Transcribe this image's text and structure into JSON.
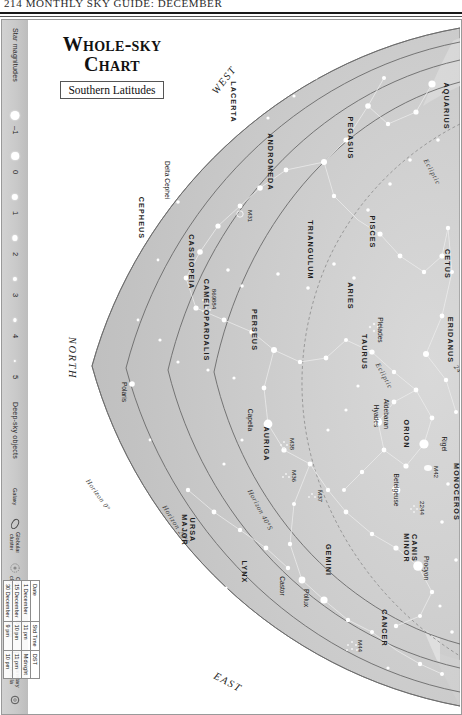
{
  "running_head": "214   MONTHLY SKY GUIDE: DECEMBER",
  "title": {
    "line1": "Whole-sky",
    "line2": "Chart",
    "subtitle": "Southern Latitudes"
  },
  "legend": {
    "magnitudes": {
      "heading": "Star magnitudes",
      "items": [
        {
          "label": "–1",
          "size": 9
        },
        {
          "label": "0",
          "size": 7.6
        },
        {
          "label": "1",
          "size": 6.4
        },
        {
          "label": "2",
          "size": 5.2
        },
        {
          "label": "3",
          "size": 4.2
        },
        {
          "label": "4",
          "size": 3.2
        },
        {
          "label": "5",
          "size": 2.4
        }
      ]
    },
    "deep_sky": {
      "heading": "Deep-sky objects",
      "items": [
        {
          "label": "Galaxy",
          "icon": "ellipse-outline-icon"
        },
        {
          "label": "Globular\ncluster",
          "icon": "globular-cluster-icon"
        },
        {
          "label": "Open\ncluster",
          "icon": "open-cluster-icon"
        },
        {
          "label": "Diffuse\nnebula",
          "icon": "square-outline-icon"
        },
        {
          "label": "Planetary\nnebula",
          "icon": "circle-outline-icon"
        }
      ]
    }
  },
  "date_table": {
    "headers": [
      "Date",
      "Std Time",
      "DST"
    ],
    "rows": [
      [
        "1 December",
        "11 pm",
        "Midnight"
      ],
      [
        "15 December",
        "10 pm",
        "11 pm"
      ],
      [
        "30 December",
        "9 pm",
        "10 pm"
      ]
    ]
  },
  "directions": [
    {
      "label": "WEST",
      "x": 196,
      "y": 60,
      "rot": -52
    },
    {
      "label": "NORTH",
      "x": 44,
      "y": 338,
      "rot": 90
    },
    {
      "label": "EAST",
      "x": 200,
      "y": 662,
      "rot": 28
    }
  ],
  "horizon_labels": [
    {
      "label": "Horizon 0°",
      "x": 70,
      "y": 475,
      "rot": 55
    },
    {
      "label": "Horizon 20°S",
      "x": 148,
      "y": 505,
      "rot": 58
    },
    {
      "label": "Horizon 40°S",
      "x": 232,
      "y": 490,
      "rot": 62
    },
    {
      "label": "24°S",
      "x": 432,
      "y": 352,
      "rot": 52
    }
  ],
  "ecliptic_labels": [
    {
      "label": "Ecliptic",
      "x": 404,
      "y": 152,
      "rot": 62
    },
    {
      "label": "Ecliptic",
      "x": 356,
      "y": 356,
      "rot": 62
    }
  ],
  "constellations": [
    {
      "name": "AQUARIUS",
      "x": 418,
      "y": 86,
      "rot": 90
    },
    {
      "name": "PEGASUS",
      "x": 322,
      "y": 118,
      "rot": 90
    },
    {
      "name": "LACERTA",
      "x": 205,
      "y": 82,
      "rot": 90
    },
    {
      "name": "ANDROMEDA",
      "x": 242,
      "y": 142,
      "rot": 90
    },
    {
      "name": "PISCES",
      "x": 344,
      "y": 212,
      "rot": 90
    },
    {
      "name": "CETUS",
      "x": 419,
      "y": 244,
      "rot": 90
    },
    {
      "name": "CEPHEUS",
      "x": 113,
      "y": 198,
      "rot": 90
    },
    {
      "name": "CASSIOPEIA",
      "x": 163,
      "y": 242,
      "rot": 90
    },
    {
      "name": "TRIANGULUM",
      "x": 282,
      "y": 230,
      "rot": 90
    },
    {
      "name": "ARIES",
      "x": 322,
      "y": 276,
      "rot": 90
    },
    {
      "name": "ERIDANUS",
      "x": 422,
      "y": 320,
      "rot": 90
    },
    {
      "name": "PERSEUS",
      "x": 226,
      "y": 310,
      "rot": 90
    },
    {
      "name": "CAMELOPARDALIS",
      "x": 178,
      "y": 300,
      "rot": 90
    },
    {
      "name": "TAURUS",
      "x": 336,
      "y": 332,
      "rot": 90
    },
    {
      "name": "AURIGA",
      "x": 238,
      "y": 424,
      "rot": 90
    },
    {
      "name": "ORION",
      "x": 378,
      "y": 414,
      "rot": 90
    },
    {
      "name": "MONOCEROS",
      "x": 428,
      "y": 472,
      "rot": 90
    },
    {
      "name": "URSA MAJOR",
      "x": 160,
      "y": 510,
      "rot": 90
    },
    {
      "name": "LYNX",
      "x": 216,
      "y": 552,
      "rot": 90
    },
    {
      "name": "GEMINI",
      "x": 300,
      "y": 540,
      "rot": 90
    },
    {
      "name": "CANIS MINOR",
      "x": 382,
      "y": 528,
      "rot": 90
    },
    {
      "name": "CANCER",
      "x": 356,
      "y": 608,
      "rot": 90
    },
    {
      "name": "HYDRA",
      "x": 438,
      "y": 620,
      "rot": 90
    }
  ],
  "stars": [
    {
      "name": "Delta Cephei",
      "x": 139,
      "y": 160,
      "rot": 90
    },
    {
      "name": "Polaris",
      "x": 96,
      "y": 372,
      "rot": 90
    },
    {
      "name": "Capella",
      "x": 222,
      "y": 400,
      "rot": 90
    },
    {
      "name": "Pleiades",
      "x": 352,
      "y": 310,
      "rot": 90
    },
    {
      "name": "Aldebaran",
      "x": 358,
      "y": 394,
      "rot": 90
    },
    {
      "name": "Hyades",
      "x": 348,
      "y": 396,
      "rot": 90
    },
    {
      "name": "Rigel",
      "x": 416,
      "y": 424,
      "rot": 90
    },
    {
      "name": "Betelgeuse",
      "x": 368,
      "y": 470,
      "rot": 90
    },
    {
      "name": "Procyon",
      "x": 398,
      "y": 548,
      "rot": 90
    },
    {
      "name": "Castor",
      "x": 254,
      "y": 566,
      "rot": 90
    },
    {
      "name": "Pollux",
      "x": 278,
      "y": 578,
      "rot": 90
    }
  ],
  "deep_sky_objects": [
    {
      "name": "M31",
      "x": 222,
      "y": 196,
      "rot": 90
    },
    {
      "name": "869",
      "x": 186,
      "y": 274,
      "rot": 90
    },
    {
      "name": "884",
      "x": 186,
      "y": 284,
      "rot": 90
    },
    {
      "name": "M38",
      "x": 264,
      "y": 424,
      "rot": 90
    },
    {
      "name": "M36",
      "x": 266,
      "y": 456,
      "rot": 90
    },
    {
      "name": "M37",
      "x": 292,
      "y": 476,
      "rot": 90
    },
    {
      "name": "M42",
      "x": 408,
      "y": 452,
      "rot": 90
    },
    {
      "name": "2244",
      "x": 394,
      "y": 488,
      "rot": 90
    },
    {
      "name": "M44",
      "x": 332,
      "y": 626,
      "rot": 90
    }
  ],
  "colors": {
    "sky_fill": "#c4c4c4",
    "sky_fill_light": "#d8d8d8",
    "horizon_line": "#6a6a6a",
    "star_white": "#ffffff",
    "constellation_line": "#e8e8e8",
    "legend_bg": "#cacaca",
    "frame": "#9a9a9a"
  }
}
